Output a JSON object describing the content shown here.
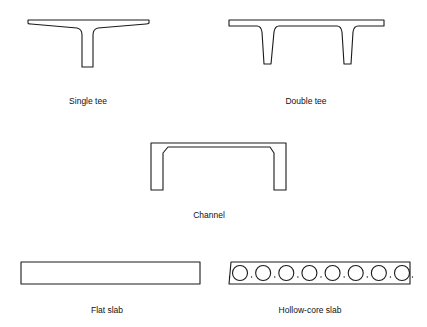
{
  "figure": {
    "sections": [
      {
        "id": "single-tee",
        "label": "Single tee"
      },
      {
        "id": "double-tee",
        "label": "Double tee"
      },
      {
        "id": "channel",
        "label": "Channel"
      },
      {
        "id": "flat-slab",
        "label": "Flat slab"
      },
      {
        "id": "hollow-core-slab",
        "label": "Hollow-core slab",
        "core_count": 8
      }
    ]
  }
}
